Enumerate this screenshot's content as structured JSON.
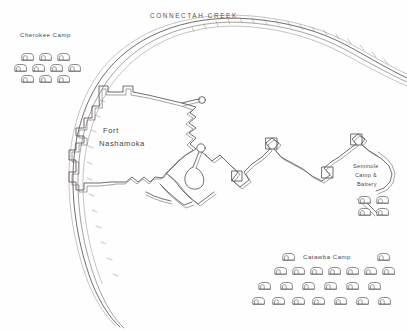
{
  "map": {
    "title": "Fort Nashamoka Siege Sketch Map",
    "medium": "pencil sketch",
    "paper_color": "#fefefe",
    "ink_color": "#595451",
    "width": 407,
    "height": 331
  },
  "labels": {
    "creek": "CONNECTAH   CREEK",
    "fort_line1": "Fort",
    "fort_line2": "Nashamoka",
    "cherokee_camp": "Cherokee Camp",
    "catawba_camp": "Catawba Camp",
    "seminole_line1": "Seminole",
    "seminole_line2": "Camp &",
    "seminole_line3": "Battery"
  },
  "features": {
    "creek_name": "Connectah Creek",
    "fort_name": "Fort Nashamoka",
    "fort_type": "bastioned earthwork fort",
    "siege_works": "zigzag approach trenches with redoubts",
    "battery_symbol": "mortar battery",
    "camps": [
      {
        "name": "Cherokee Camp",
        "position": "upper-left",
        "hut_rows": [
          3,
          4,
          3
        ],
        "hut_count": 10
      },
      {
        "name": "Seminole Camp & Battery",
        "position": "right",
        "hut_rows": [
          2,
          2
        ],
        "hut_count": 4
      },
      {
        "name": "Catawba Camp",
        "position": "bottom-right",
        "hut_rows": [
          2,
          7,
          6,
          7
        ],
        "hut_count": 22
      }
    ]
  },
  "symbols": {
    "hut": "dome-hut-icon",
    "redoubt": "square-redoubt-icon",
    "mortar": "mortar-battery-icon",
    "trench": "zigzag-trench-icon"
  }
}
